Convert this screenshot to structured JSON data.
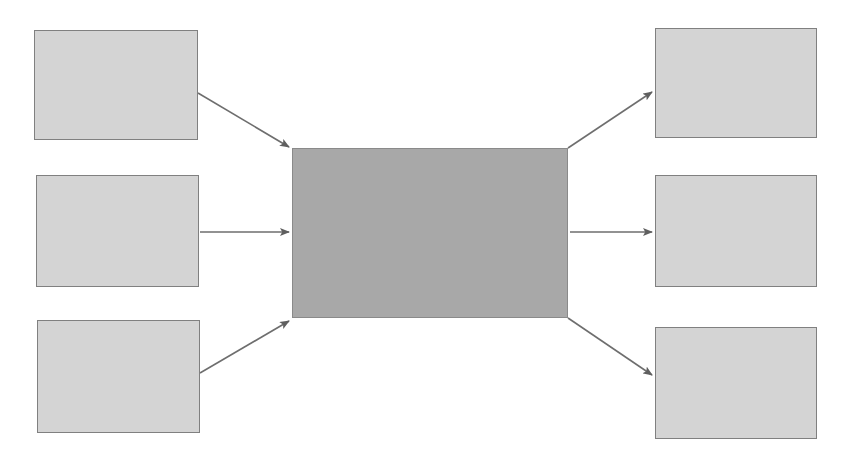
{
  "diagram": {
    "title": "",
    "canvas": {
      "width": 852,
      "height": 467,
      "background": "#ffffff"
    },
    "palette": {
      "page_background": "#ffffff",
      "input_fill": "#d4d4d4",
      "input_stroke": "#808080",
      "hub_fill": "#a8a8a8",
      "hub_stroke": "#8a8a8a",
      "output_fill": "#d4d4d4",
      "output_stroke": "#808080",
      "connector_stroke": "#6e6e6e"
    },
    "inputs": [
      {
        "id": "input-1",
        "label": "",
        "x": 34,
        "y": 30,
        "width": 164,
        "height": 110
      },
      {
        "id": "input-2",
        "label": "",
        "x": 36,
        "y": 175,
        "width": 163,
        "height": 112
      },
      {
        "id": "input-3",
        "label": "",
        "x": 37,
        "y": 320,
        "width": 163,
        "height": 113
      }
    ],
    "hub": {
      "id": "hub",
      "label": "",
      "x": 292,
      "y": 148,
      "width": 276,
      "height": 170
    },
    "outputs": [
      {
        "id": "output-1",
        "label": "",
        "x": 655,
        "y": 28,
        "width": 162,
        "height": 110
      },
      {
        "id": "output-2",
        "label": "",
        "x": 655,
        "y": 175,
        "width": 162,
        "height": 112
      },
      {
        "id": "output-3",
        "label": "",
        "x": 655,
        "y": 327,
        "width": 162,
        "height": 112
      }
    ],
    "connectors": [
      {
        "id": "connector-input-1-to-hub",
        "from": "input-1",
        "to": "hub",
        "label": "",
        "x1": 198,
        "y1": 93,
        "x2": 289,
        "y2": 147,
        "direction": "down-right"
      },
      {
        "id": "connector-input-2-to-hub",
        "from": "input-2",
        "to": "hub",
        "label": "",
        "x1": 200,
        "y1": 232,
        "x2": 289,
        "y2": 232,
        "direction": "right"
      },
      {
        "id": "connector-input-3-to-hub",
        "from": "input-3",
        "to": "hub",
        "label": "",
        "x1": 200,
        "y1": 373,
        "x2": 289,
        "y2": 321,
        "direction": "up-right"
      },
      {
        "id": "connector-hub-to-output-1",
        "from": "hub",
        "to": "output-1",
        "label": "",
        "x1": 568,
        "y1": 148,
        "x2": 652,
        "y2": 92,
        "direction": "up-right"
      },
      {
        "id": "connector-hub-to-output-2",
        "from": "hub",
        "to": "output-2",
        "label": "",
        "x1": 570,
        "y1": 232,
        "x2": 652,
        "y2": 232,
        "direction": "right"
      },
      {
        "id": "connector-hub-to-output-3",
        "from": "hub",
        "to": "output-3",
        "label": "",
        "x1": 568,
        "y1": 318,
        "x2": 652,
        "y2": 375,
        "direction": "down-right"
      }
    ]
  }
}
